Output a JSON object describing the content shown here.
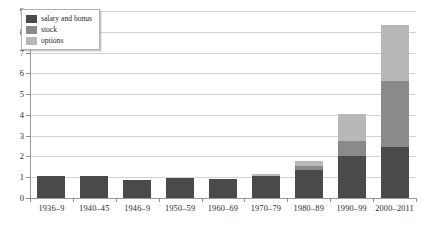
{
  "chart_data": {
    "type": "bar",
    "stacked": true,
    "title": "",
    "subtitle": "",
    "xlabel": "",
    "ylabel": "",
    "ylim": [
      0,
      9
    ],
    "ytick_labels": [
      "0",
      "1",
      "2",
      "3",
      "4",
      "5",
      "6",
      "7",
      "8",
      "9"
    ],
    "ytick_values": [
      0,
      1,
      2,
      3,
      4,
      5,
      6,
      7,
      8,
      9
    ],
    "grid": true,
    "legend_position": "top-left",
    "categories": [
      "1936–9",
      "1940–45",
      "1946–9",
      "1950–59",
      "1960–69",
      "1970–79",
      "1980–89",
      "1990–99",
      "2000–2011"
    ],
    "series": [
      {
        "name": "salary and bonus",
        "color": "#4a4a4a",
        "values": [
          1.05,
          1.07,
          0.85,
          0.95,
          0.9,
          1.05,
          1.35,
          2.0,
          2.45
        ]
      },
      {
        "name": "stock",
        "color": "#8a8a8a",
        "values": [
          0,
          0,
          0,
          0,
          0,
          0.02,
          0.2,
          0.75,
          3.2
        ]
      },
      {
        "name": "options",
        "color": "#b8b8b8",
        "values": [
          0,
          0,
          0,
          0,
          0,
          0.08,
          0.25,
          1.3,
          2.7
        ]
      }
    ],
    "totals": [
      1.05,
      1.07,
      0.85,
      0.95,
      0.9,
      1.15,
      1.8,
      4.05,
      8.35
    ]
  },
  "legend": {
    "items": [
      {
        "label": "salary and bonus",
        "color": "#4a4a4a"
      },
      {
        "label": "stock",
        "color": "#8a8a8a"
      },
      {
        "label": "options",
        "color": "#b8b8b8"
      }
    ]
  },
  "caption": {
    "text": ""
  }
}
